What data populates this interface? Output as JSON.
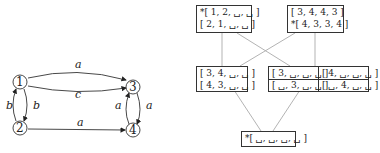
{
  "graph": {
    "nodes": [
      {
        "id": "1",
        "label": "1"
      },
      {
        "id": "2",
        "label": "2"
      },
      {
        "id": "3",
        "label": "3"
      },
      {
        "id": "4",
        "label": "4"
      }
    ],
    "edges": [
      {
        "from": "1",
        "to": "3",
        "label": "a"
      },
      {
        "from": "1",
        "to": "3",
        "label": "c"
      },
      {
        "from": "1",
        "to": "2",
        "label": "b"
      },
      {
        "from": "2",
        "to": "1",
        "label": "b"
      },
      {
        "from": "3",
        "to": "4",
        "label": "a"
      },
      {
        "from": "4",
        "to": "3",
        "label": "a"
      },
      {
        "from": "2",
        "to": "4",
        "label": "a"
      }
    ]
  },
  "lattice": {
    "top_left": {
      "rows": [
        "*[ 1, 2, ␣, ␣ ]",
        "[ 2, 1, ␣, ␣ ]"
      ]
    },
    "top_right": {
      "rows": [
        "[ 3, 4, 4, 3 ]",
        "*[ 4, 3, 3, 4 ]"
      ]
    },
    "mid_left": {
      "rows": [
        "[ 3, 4, ␣, ␣ ]",
        "[ 4, 3, ␣, ␣ ]"
      ]
    },
    "mid_right_a": {
      "rows": [
        "[ 3, ␣, ␣, ␣ ]",
        "[ ␣, 3, ␣, ␣ ]"
      ]
    },
    "mid_right_b": {
      "rows": [
        "[ 4, ␣, ␣, ␣ ]",
        "[ ␣, 4, ␣, ␣ ]"
      ]
    },
    "bottom": {
      "rows": [
        "*[ ␣, ␣, ␣, ␣ ]"
      ]
    }
  }
}
